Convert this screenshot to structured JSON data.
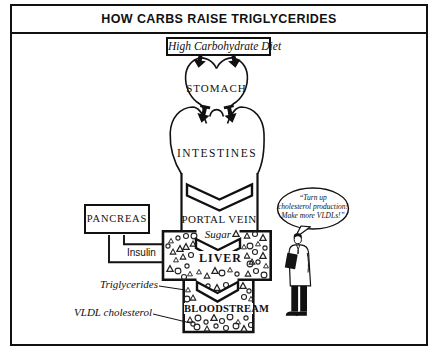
{
  "header": {
    "title": "HOW CARBS RAISE TRIGLYCERIDES"
  },
  "flow": {
    "diet": "High Carbohydrate Diet",
    "stomach": "STOMACH",
    "intestines": "INTESTINES",
    "portal_vein": "PORTAL VEIN",
    "sugar": "Sugar",
    "liver": "LIVER",
    "bloodstream": "BLOODSTREAM"
  },
  "pancreas": {
    "label": "PANCREAS",
    "hormone": "Insulin"
  },
  "annotations": {
    "triglycerides": "Triglycerides",
    "vldl_cholesterol": "VLDL cholesterol"
  },
  "speech": {
    "line1": "“Turn up",
    "line2": "cholesterol production!",
    "line3": "Make more VLDLs!”"
  },
  "colors": {
    "ink": "#111111",
    "background": "#ffffff"
  }
}
